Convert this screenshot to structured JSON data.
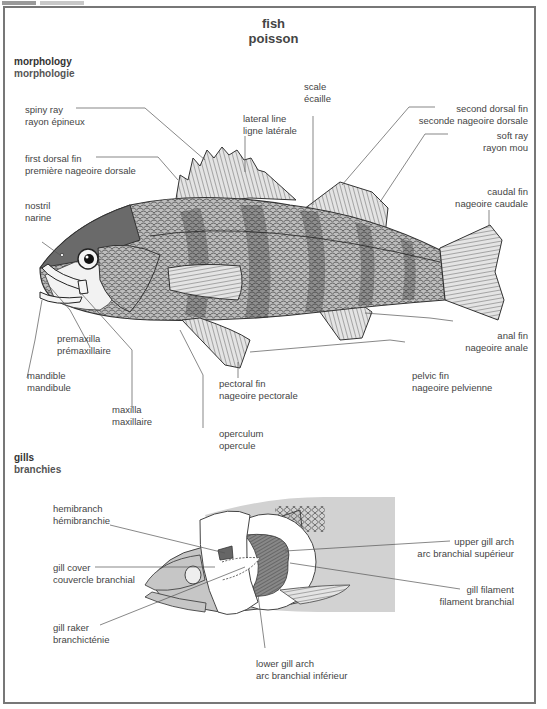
{
  "header": {
    "title_en": "fish",
    "title_fr": "poisson"
  },
  "sections": {
    "morphology": {
      "en": "morphology",
      "fr": "morphologie"
    },
    "gills": {
      "en": "gills",
      "fr": "branchies"
    }
  },
  "morphology_labels": {
    "spiny_ray": {
      "en": "spiny ray",
      "fr": "rayon épineux"
    },
    "first_dorsal_fin": {
      "en": "first dorsal fin",
      "fr": "première nageoire dorsale"
    },
    "nostril": {
      "en": "nostril",
      "fr": "narine"
    },
    "lateral_line": {
      "en": "lateral line",
      "fr": "ligne latérale"
    },
    "scale": {
      "en": "scale",
      "fr": "écaille"
    },
    "second_dorsal_fin": {
      "en": "second dorsal fin",
      "fr": "seconde nageoire dorsale"
    },
    "soft_ray": {
      "en": "soft ray",
      "fr": "rayon mou"
    },
    "caudal_fin": {
      "en": "caudal fin",
      "fr": "nageoire caudale"
    },
    "premaxilla": {
      "en": "premaxilla",
      "fr": "prémaxillaire"
    },
    "mandible": {
      "en": "mandible",
      "fr": "mandibule"
    },
    "maxilla": {
      "en": "maxilla",
      "fr": "maxillaire"
    },
    "pectoral_fin": {
      "en": "pectoral fin",
      "fr": "nageoire pectorale"
    },
    "operculum": {
      "en": "operculum",
      "fr": "opercule"
    },
    "anal_fin": {
      "en": "anal fin",
      "fr": "nageoire anale"
    },
    "pelvic_fin": {
      "en": "pelvic fin",
      "fr": "nageoire pelvienne"
    }
  },
  "gill_labels": {
    "hemibranch": {
      "en": "hemibranch",
      "fr": "hémibranchie"
    },
    "gill_cover": {
      "en": "gill cover",
      "fr": "couvercle branchial"
    },
    "gill_raker": {
      "en": "gill raker",
      "fr": "branchicténie"
    },
    "upper_gill_arch": {
      "en": "upper gill arch",
      "fr": "arc branchial supérieur"
    },
    "gill_filament": {
      "en": "gill filament",
      "fr": "filament branchial"
    },
    "lower_gill_arch": {
      "en": "lower gill arch",
      "fr": "arc branchial inférieur"
    }
  },
  "colors": {
    "frame": "#777777",
    "text": "#444444",
    "fish_fill": "#b5b5b5",
    "fish_dark": "#555555",
    "gill_panel": "#d0d0d0",
    "leader_line": "#555555"
  }
}
